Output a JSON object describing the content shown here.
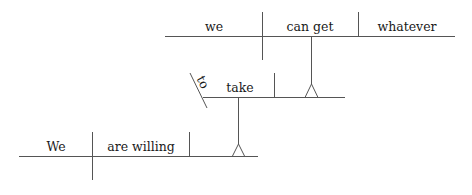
{
  "diagram": {
    "type": "sentence-diagram",
    "sentence": "We are willing to take whatever we can get",
    "main_clause": {
      "subject": "We",
      "predicate": "are willing"
    },
    "infinitive_phrase": {
      "marker": "to",
      "verb": "take"
    },
    "noun_clause": {
      "subject": "we",
      "predicate": "can get",
      "object": "whatever"
    }
  }
}
